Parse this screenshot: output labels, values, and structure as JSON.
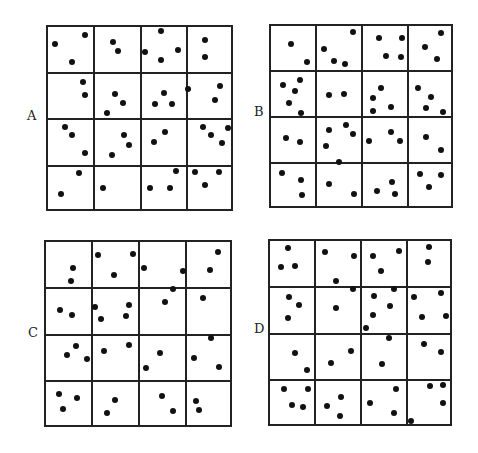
{
  "figure": {
    "colors": {
      "line": "#222222",
      "dot": "#111111",
      "background": "#ffffff"
    },
    "panels": [
      {
        "label": "A",
        "label_pos": [
          27,
          109
        ],
        "box": [
          46,
          25,
          233,
          211
        ],
        "grid": [
          4,
          4
        ],
        "dots": [
          [
            55,
            44
          ],
          [
            85,
            35
          ],
          [
            72,
            62
          ],
          [
            113,
            42
          ],
          [
            118,
            51
          ],
          [
            145,
            52
          ],
          [
            161,
            31
          ],
          [
            161,
            60
          ],
          [
            178,
            50
          ],
          [
            205,
            40
          ],
          [
            205,
            57
          ],
          [
            83,
            82
          ],
          [
            85,
            95
          ],
          [
            115,
            94
          ],
          [
            123,
            103
          ],
          [
            107,
            113
          ],
          [
            155,
            104
          ],
          [
            164,
            93
          ],
          [
            172,
            104
          ],
          [
            188,
            89
          ],
          [
            220,
            86
          ],
          [
            215,
            100
          ],
          [
            65,
            127
          ],
          [
            72,
            135
          ],
          [
            85,
            153
          ],
          [
            124,
            135
          ],
          [
            129,
            145
          ],
          [
            112,
            155
          ],
          [
            154,
            142
          ],
          [
            165,
            132
          ],
          [
            203,
            127
          ],
          [
            211,
            135
          ],
          [
            222,
            143
          ],
          [
            228,
            128
          ],
          [
            79,
            173
          ],
          [
            61,
            194
          ],
          [
            103,
            188
          ],
          [
            150,
            188
          ],
          [
            170,
            188
          ],
          [
            176,
            171
          ],
          [
            195,
            172
          ],
          [
            219,
            172
          ],
          [
            205,
            185
          ]
        ]
      },
      {
        "label": "B",
        "label_pos": [
          254,
          105
        ],
        "box": [
          269,
          24,
          453,
          208
        ],
        "grid": [
          4,
          4
        ],
        "dots": [
          [
            291,
            44
          ],
          [
            307,
            62
          ],
          [
            353,
            32
          ],
          [
            324,
            49
          ],
          [
            334,
            61
          ],
          [
            345,
            64
          ],
          [
            379,
            38
          ],
          [
            402,
            38
          ],
          [
            386,
            56
          ],
          [
            401,
            57
          ],
          [
            441,
            33
          ],
          [
            425,
            47
          ],
          [
            437,
            59
          ],
          [
            283,
            85
          ],
          [
            300,
            80
          ],
          [
            295,
            91
          ],
          [
            289,
            103
          ],
          [
            301,
            113
          ],
          [
            329,
            95
          ],
          [
            344,
            94
          ],
          [
            381,
            88
          ],
          [
            373,
            98
          ],
          [
            373,
            111
          ],
          [
            391,
            107
          ],
          [
            418,
            88
          ],
          [
            431,
            97
          ],
          [
            426,
            108
          ],
          [
            443,
            112
          ],
          [
            286,
            138
          ],
          [
            300,
            142
          ],
          [
            329,
            130
          ],
          [
            346,
            125
          ],
          [
            353,
            134
          ],
          [
            326,
            146
          ],
          [
            339,
            162
          ],
          [
            369,
            141
          ],
          [
            391,
            132
          ],
          [
            400,
            141
          ],
          [
            426,
            137
          ],
          [
            441,
            150
          ],
          [
            282,
            173
          ],
          [
            301,
            180
          ],
          [
            302,
            195
          ],
          [
            329,
            184
          ],
          [
            354,
            194
          ],
          [
            377,
            191
          ],
          [
            392,
            182
          ],
          [
            395,
            194
          ],
          [
            420,
            174
          ],
          [
            441,
            175
          ],
          [
            429,
            187
          ]
        ]
      },
      {
        "label": "C",
        "label_pos": [
          28,
          326
        ],
        "box": [
          44,
          240,
          232,
          427
        ],
        "grid": [
          4,
          4
        ],
        "dots": [
          [
            73,
            268
          ],
          [
            71,
            281
          ],
          [
            98,
            255
          ],
          [
            133,
            254
          ],
          [
            114,
            275
          ],
          [
            144,
            268
          ],
          [
            183,
            271
          ],
          [
            218,
            252
          ],
          [
            210,
            270
          ],
          [
            60,
            310
          ],
          [
            72,
            315
          ],
          [
            95,
            307
          ],
          [
            101,
            319
          ],
          [
            129,
            305
          ],
          [
            126,
            316
          ],
          [
            165,
            302
          ],
          [
            173,
            289
          ],
          [
            203,
            298
          ],
          [
            76,
            346
          ],
          [
            67,
            355
          ],
          [
            87,
            359
          ],
          [
            104,
            351
          ],
          [
            129,
            345
          ],
          [
            160,
            353
          ],
          [
            146,
            368
          ],
          [
            211,
            338
          ],
          [
            194,
            358
          ],
          [
            219,
            367
          ],
          [
            59,
            394
          ],
          [
            77,
            398
          ],
          [
            63,
            409
          ],
          [
            115,
            400
          ],
          [
            107,
            413
          ],
          [
            162,
            396
          ],
          [
            173,
            411
          ],
          [
            196,
            401
          ],
          [
            199,
            410
          ]
        ]
      },
      {
        "label": "D",
        "label_pos": [
          254,
          322
        ],
        "box": [
          268,
          239,
          452,
          426
        ],
        "grid": [
          4,
          4
        ],
        "dots": [
          [
            288,
            248
          ],
          [
            281,
            267
          ],
          [
            295,
            266
          ],
          [
            325,
            252
          ],
          [
            354,
            256
          ],
          [
            336,
            281
          ],
          [
            373,
            256
          ],
          [
            399,
            251
          ],
          [
            381,
            271
          ],
          [
            429,
            247
          ],
          [
            428,
            262
          ],
          [
            289,
            297
          ],
          [
            299,
            305
          ],
          [
            288,
            318
          ],
          [
            336,
            308
          ],
          [
            353,
            289
          ],
          [
            374,
            296
          ],
          [
            394,
            289
          ],
          [
            390,
            306
          ],
          [
            373,
            315
          ],
          [
            366,
            328
          ],
          [
            414,
            297
          ],
          [
            441,
            293
          ],
          [
            422,
            317
          ],
          [
            446,
            316
          ],
          [
            295,
            353
          ],
          [
            307,
            370
          ],
          [
            331,
            363
          ],
          [
            351,
            351
          ],
          [
            389,
            338
          ],
          [
            382,
            364
          ],
          [
            424,
            344
          ],
          [
            441,
            352
          ],
          [
            284,
            389
          ],
          [
            308,
            389
          ],
          [
            292,
            405
          ],
          [
            303,
            407
          ],
          [
            341,
            397
          ],
          [
            327,
            406
          ],
          [
            340,
            416
          ],
          [
            370,
            403
          ],
          [
            396,
            389
          ],
          [
            394,
            413
          ],
          [
            430,
            386
          ],
          [
            443,
            385
          ],
          [
            443,
            403
          ],
          [
            411,
            421
          ]
        ]
      }
    ]
  }
}
